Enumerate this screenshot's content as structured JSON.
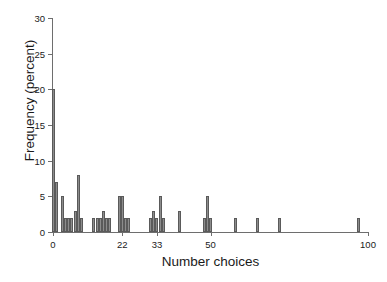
{
  "figure": {
    "top_fragment": "",
    "background": "#ffffff",
    "bar_fill": "#8c8c8c",
    "bar_edge": "#5a5a5a",
    "axis_color": "#6e6e6e"
  },
  "chart_data": {
    "type": "bar",
    "title": "",
    "xlabel": "Number choices",
    "ylabel": "Frequency (percent)",
    "xlim": [
      0,
      100
    ],
    "ylim": [
      0,
      30
    ],
    "grid": false,
    "legend": null,
    "ytick_labels": [
      "0",
      "5",
      "10",
      "15",
      "20",
      "25",
      "30"
    ],
    "ytick_values": [
      0,
      5,
      10,
      15,
      20,
      25,
      30
    ],
    "xtick_labels": [
      "0",
      "22",
      "33",
      "50",
      "100"
    ],
    "xtick_values": [
      0,
      22,
      33,
      50,
      100
    ],
    "x": [
      0,
      1,
      3,
      4,
      5,
      6,
      7,
      8,
      9,
      13,
      14,
      15,
      16,
      17,
      18,
      21,
      22,
      23,
      24,
      31,
      32,
      33,
      34,
      35,
      40,
      48,
      49,
      50,
      58,
      65,
      72,
      97
    ],
    "values": [
      20,
      7,
      5,
      2,
      2,
      2,
      3,
      8,
      2,
      2,
      2,
      2,
      3,
      2,
      2,
      5,
      5,
      2,
      2,
      2,
      3,
      2,
      5,
      2,
      3,
      2,
      5,
      2,
      2,
      2,
      2,
      2
    ]
  }
}
